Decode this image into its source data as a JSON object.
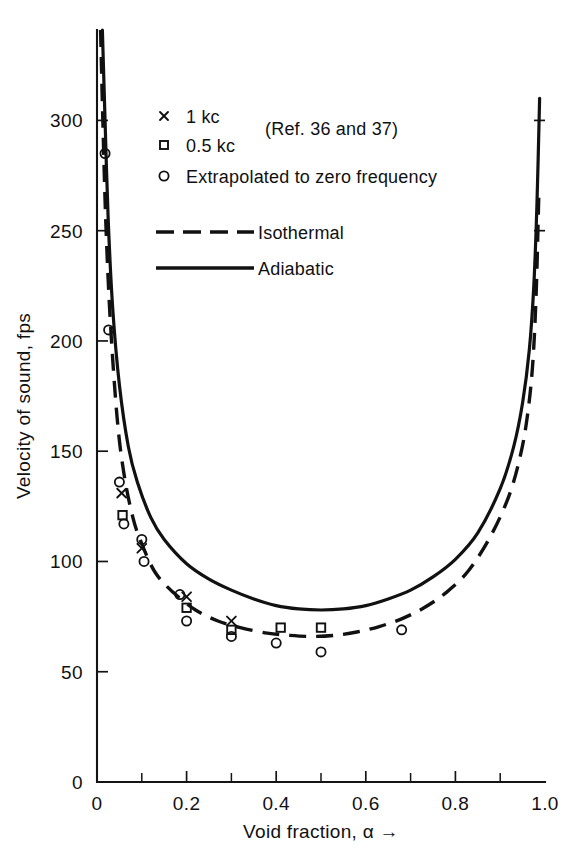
{
  "chart_data": {
    "type": "line",
    "title": "",
    "xlabel": "Void fraction, α →",
    "ylabel": "Velocity of sound, fps",
    "xlim": [
      0,
      1.0
    ],
    "ylim": [
      0,
      341
    ],
    "grid": false,
    "xticks": [
      0,
      0.2,
      0.4,
      0.6,
      0.8,
      1.0
    ],
    "xtick_labels": [
      "0",
      "0.2",
      "0.4",
      "0.6",
      "0.8",
      "1.0"
    ],
    "xminor_ticks": [
      0.1,
      0.3,
      0.5,
      0.7,
      0.9
    ],
    "yticks": [
      0,
      50,
      100,
      150,
      200,
      250,
      300
    ],
    "ytick_labels": [
      "0",
      "50",
      "100",
      "150",
      "200",
      "250",
      "300"
    ],
    "legend_position": "upper-center",
    "series": [
      {
        "name": "Adiabatic",
        "style": "solid",
        "x": [
          0.012,
          0.018,
          0.025,
          0.035,
          0.05,
          0.07,
          0.09,
          0.12,
          0.15,
          0.2,
          0.25,
          0.3,
          0.35,
          0.4,
          0.45,
          0.5,
          0.55,
          0.6,
          0.65,
          0.7,
          0.75,
          0.8,
          0.85,
          0.9,
          0.93,
          0.95,
          0.965,
          0.975,
          0.982,
          0.988
        ],
        "y": [
          341,
          300,
          255,
          215,
          180,
          152,
          136,
          120,
          110,
          99,
          92,
          87,
          83,
          80,
          78.5,
          78,
          78.5,
          80,
          83,
          87,
          93,
          101,
          113,
          133,
          152,
          172,
          196,
          225,
          262,
          310
        ]
      },
      {
        "name": "Isothermal",
        "style": "dashed",
        "x": [
          0.008,
          0.013,
          0.02,
          0.03,
          0.045,
          0.06,
          0.08,
          0.1,
          0.13,
          0.17,
          0.22,
          0.27,
          0.32,
          0.38,
          0.43,
          0.48,
          0.53,
          0.58,
          0.63,
          0.68,
          0.73,
          0.78,
          0.83,
          0.88,
          0.92,
          0.945,
          0.96,
          0.972,
          0.98,
          0.986
        ],
        "y": [
          341,
          300,
          252,
          208,
          165,
          140,
          120,
          108,
          95,
          86,
          78,
          73,
          70,
          67.5,
          66.5,
          66,
          66.5,
          68,
          70.5,
          74,
          79,
          86,
          96,
          112,
          130,
          148,
          165,
          188,
          220,
          265
        ]
      }
    ],
    "scatter_series": [
      {
        "name": "1 kc",
        "marker": "cross",
        "points": [
          {
            "x": 0.055,
            "y": 131
          },
          {
            "x": 0.1,
            "y": 106
          },
          {
            "x": 0.2,
            "y": 84
          },
          {
            "x": 0.3,
            "y": 73
          }
        ]
      },
      {
        "name": "0.5 kc",
        "marker": "square",
        "points": [
          {
            "x": 0.057,
            "y": 121
          },
          {
            "x": 0.2,
            "y": 79
          },
          {
            "x": 0.3,
            "y": 69
          },
          {
            "x": 0.41,
            "y": 70
          },
          {
            "x": 0.5,
            "y": 70
          }
        ]
      },
      {
        "name": "Extrapolated to zero frequency",
        "marker": "circle",
        "points": [
          {
            "x": 0.018,
            "y": 285
          },
          {
            "x": 0.026,
            "y": 205
          },
          {
            "x": 0.05,
            "y": 136
          },
          {
            "x": 0.06,
            "y": 117
          },
          {
            "x": 0.1,
            "y": 110
          },
          {
            "x": 0.105,
            "y": 100
          },
          {
            "x": 0.185,
            "y": 85
          },
          {
            "x": 0.2,
            "y": 73
          },
          {
            "x": 0.3,
            "y": 66
          },
          {
            "x": 0.4,
            "y": 63
          },
          {
            "x": 0.5,
            "y": 59
          },
          {
            "x": 0.68,
            "y": 69
          }
        ]
      }
    ]
  },
  "legend": {
    "marker_entries": [
      {
        "marker": "cross",
        "label": "1 kc"
      },
      {
        "marker": "square",
        "label": "0.5 kc"
      },
      {
        "marker": "circle",
        "label": "Extrapolated to zero frequency"
      }
    ],
    "reference_note": "(Ref. 36 and 37)",
    "line_entries": [
      {
        "style": "dashed",
        "label": "Isothermal"
      },
      {
        "style": "solid",
        "label": "Adiabatic"
      }
    ]
  }
}
